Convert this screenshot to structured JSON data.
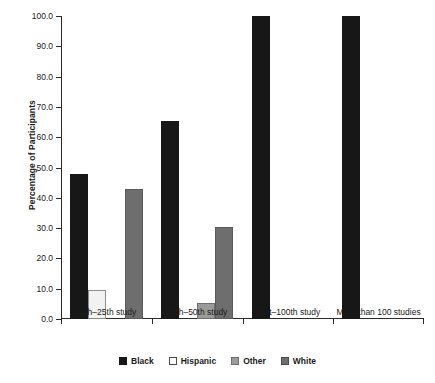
{
  "chart_data": {
    "type": "bar",
    "title": "",
    "xlabel": "",
    "ylabel": "Percentage of Participants",
    "ylim": [
      0.0,
      100.0
    ],
    "ytick_step": 10.0,
    "ytick_labels": [
      "0.0",
      "10.0",
      "20.0",
      "30.0",
      "40.0",
      "50.0",
      "60.0",
      "70.0",
      "80.0",
      "90.0",
      "100.0"
    ],
    "ytick_values": [
      0.0,
      10.0,
      20.0,
      30.0,
      40.0,
      50.0,
      60.0,
      70.0,
      80.0,
      90.0,
      100.0
    ],
    "grid": false,
    "legend_position": "bottom",
    "categories": [
      "11th–25th study",
      "26th–50th study",
      "51st–100th study",
      "More than 100 studies"
    ],
    "series": [
      {
        "name": "Black",
        "color": "#171717",
        "values": [
          47.8,
          65.2,
          100.0,
          100.0
        ]
      },
      {
        "name": "Hispanic",
        "color": "#ffffff",
        "values": [
          9.6,
          0,
          0,
          0
        ]
      },
      {
        "name": "Other",
        "color": "#9b9b9b",
        "values": [
          0,
          5.2,
          0,
          0
        ]
      },
      {
        "name": "White",
        "color": "#6e6e6e",
        "values": [
          43.0,
          30.3,
          0,
          0
        ]
      }
    ]
  },
  "legend": {
    "items": [
      {
        "label": "Black",
        "swatch": "swatch-black"
      },
      {
        "label": "Hispanic",
        "swatch": "swatch-hispanic"
      },
      {
        "label": "Other",
        "swatch": "swatch-other"
      },
      {
        "label": "White",
        "swatch": "swatch-white"
      }
    ]
  }
}
